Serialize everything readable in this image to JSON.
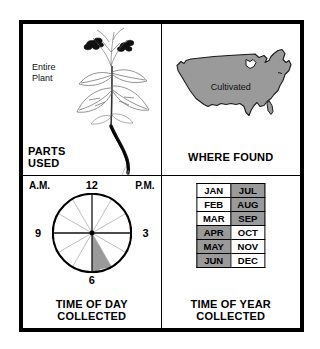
{
  "colors": {
    "shade_gray": "#9a9a9a",
    "ink": "#000000",
    "paper": "#ffffff"
  },
  "panels": {
    "parts_used": {
      "caption": "PARTS\nUSED",
      "illustration_label": "Entire\nPlant",
      "illustration_name": "plant-illustration"
    },
    "where_found": {
      "caption": "WHERE FOUND",
      "map_label": "Cultivated",
      "map_name": "united-states-map",
      "map_fill": "#9a9a9a"
    },
    "time_of_day": {
      "caption": "TIME OF DAY\nCOLLECTED",
      "am_label": "A.M.",
      "pm_label": "P.M.",
      "hour_marks": [
        "12",
        "3",
        "6",
        "9"
      ],
      "segments": 12,
      "highlighted_segment": {
        "from_hour": 5,
        "to_hour": 6,
        "fill": "#9a9a9a"
      }
    },
    "time_of_year": {
      "caption": "TIME OF YEAR\nCOLLECTED",
      "months": [
        {
          "left": "JAN",
          "left_shaded": false,
          "right": "JUL",
          "right_shaded": true
        },
        {
          "left": "FEB",
          "left_shaded": false,
          "right": "AUG",
          "right_shaded": true
        },
        {
          "left": "MAR",
          "left_shaded": false,
          "right": "SEP",
          "right_shaded": true
        },
        {
          "left": "APR",
          "left_shaded": true,
          "right": "OCT",
          "right_shaded": false
        },
        {
          "left": "MAY",
          "left_shaded": true,
          "right": "NOV",
          "right_shaded": false
        },
        {
          "left": "JUN",
          "left_shaded": true,
          "right": "DEC",
          "right_shaded": false
        }
      ]
    }
  }
}
